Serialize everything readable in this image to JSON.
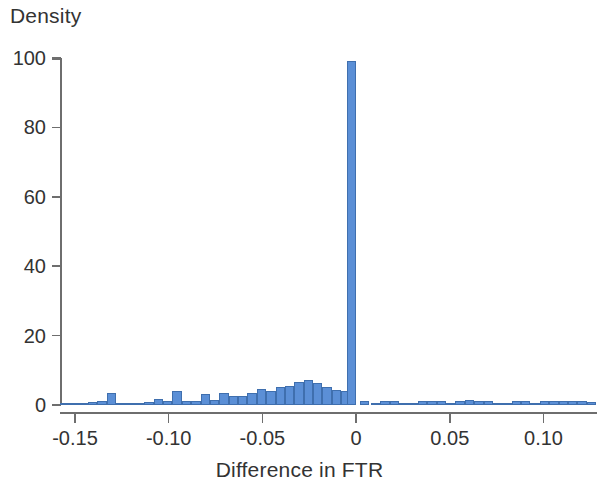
{
  "chart_data": {
    "type": "bar",
    "title": "",
    "subtitle": "",
    "xlabel": "Difference in FTR",
    "ylabel": "Density",
    "xlim": [
      -0.158,
      0.128
    ],
    "ylim": [
      0,
      103
    ],
    "grid": false,
    "legend": null,
    "bar_color": "#5b8fd6",
    "bar_edge_color": "#3f6fae",
    "axis_color": "#6e6e6e",
    "bin_width": 0.005,
    "xticks": [
      -0.15,
      -0.1,
      -0.05,
      0,
      0.05,
      0.1
    ],
    "xtick_labels": [
      "-0.15",
      "-0.10",
      "-0.05",
      "0",
      "0.05",
      "0.10"
    ],
    "yticks": [
      0,
      20,
      40,
      60,
      80,
      100
    ],
    "ytick_labels": [
      "0",
      "20",
      "40",
      "60",
      "80",
      "100"
    ],
    "annotations": [
      "Sharp spike of density ~99 at a difference of 0",
      "Left tail of negative differences with density rising from ~0.3 to ~8 near -0.03",
      "Right side of positive differences nearly flat near 0-1.5"
    ],
    "bins": [
      {
        "x": -0.1555,
        "value": 0.3
      },
      {
        "x": -0.1505,
        "value": 0.3
      },
      {
        "x": -0.1455,
        "value": 0.4
      },
      {
        "x": -0.1405,
        "value": 0.9
      },
      {
        "x": -0.1355,
        "value": 1.1
      },
      {
        "x": -0.1305,
        "value": 3.6
      },
      {
        "x": -0.1255,
        "value": 0.5
      },
      {
        "x": -0.1205,
        "value": 0.5
      },
      {
        "x": -0.1155,
        "value": 0.6
      },
      {
        "x": -0.1105,
        "value": 0.9
      },
      {
        "x": -0.1055,
        "value": 1.6
      },
      {
        "x": -0.1005,
        "value": 1.3
      },
      {
        "x": -0.0955,
        "value": 4.1
      },
      {
        "x": -0.0905,
        "value": 1.2
      },
      {
        "x": -0.0855,
        "value": 1.3
      },
      {
        "x": -0.0805,
        "value": 3.1
      },
      {
        "x": -0.0755,
        "value": 1.4
      },
      {
        "x": -0.0705,
        "value": 3.6
      },
      {
        "x": -0.0655,
        "value": 2.5
      },
      {
        "x": -0.0605,
        "value": 2.7
      },
      {
        "x": -0.0555,
        "value": 3.4
      },
      {
        "x": -0.0505,
        "value": 4.6
      },
      {
        "x": -0.0455,
        "value": 4.0
      },
      {
        "x": -0.0405,
        "value": 5.1
      },
      {
        "x": -0.0355,
        "value": 5.4
      },
      {
        "x": -0.0305,
        "value": 6.6
      },
      {
        "x": -0.0255,
        "value": 7.2
      },
      {
        "x": -0.0205,
        "value": 6.4
      },
      {
        "x": -0.0155,
        "value": 5.1
      },
      {
        "x": -0.0105,
        "value": 4.3
      },
      {
        "x": -0.0055,
        "value": 3.9
      },
      {
        "x": -0.0025,
        "value": 99.0
      },
      {
        "x": 0.0045,
        "value": 1.1
      },
      {
        "x": 0.0105,
        "value": 0.4
      },
      {
        "x": 0.0155,
        "value": 1.2
      },
      {
        "x": 0.0205,
        "value": 1.1
      },
      {
        "x": 0.0255,
        "value": 0.4
      },
      {
        "x": 0.0305,
        "value": 0.3
      },
      {
        "x": 0.0355,
        "value": 1.2
      },
      {
        "x": 0.0405,
        "value": 1.3
      },
      {
        "x": 0.0455,
        "value": 1.2
      },
      {
        "x": 0.0505,
        "value": 0.4
      },
      {
        "x": 0.0555,
        "value": 1.3
      },
      {
        "x": 0.0605,
        "value": 1.4
      },
      {
        "x": 0.0655,
        "value": 1.3
      },
      {
        "x": 0.0705,
        "value": 1.2
      },
      {
        "x": 0.0755,
        "value": 0.4
      },
      {
        "x": 0.0805,
        "value": 0.3
      },
      {
        "x": 0.0855,
        "value": 1.2
      },
      {
        "x": 0.0905,
        "value": 1.3
      },
      {
        "x": 0.0955,
        "value": 0.4
      },
      {
        "x": 0.1005,
        "value": 1.2
      },
      {
        "x": 0.1055,
        "value": 1.3
      },
      {
        "x": 0.1105,
        "value": 1.2
      },
      {
        "x": 0.1155,
        "value": 1.3
      },
      {
        "x": 0.1205,
        "value": 1.2
      },
      {
        "x": 0.1255,
        "value": 0.9
      }
    ]
  }
}
